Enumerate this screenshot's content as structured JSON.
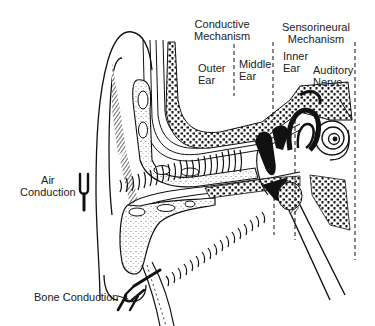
{
  "diagram": {
    "sections": {
      "conductive": {
        "line1": "Conductive",
        "line2": "Mechanism"
      },
      "sensorineural": {
        "line1": "Sensorineural",
        "line2": "Mechanism"
      }
    },
    "regions": {
      "outer_ear": {
        "line1": "Outer",
        "line2": "Ear"
      },
      "middle_ear": {
        "line1": "Middle",
        "line2": "Ear"
      },
      "inner_ear": {
        "line1": "Inner",
        "line2": "Ear"
      },
      "auditory_nerve": {
        "line1": "Auditory",
        "line2": "Nerve"
      }
    },
    "pathways": {
      "air": {
        "line1": "Air",
        "line2": "Conduction",
        "icon": "tuning-fork-icon"
      },
      "bone": {
        "label": "Bone Conduction",
        "icon": "tuning-fork-icon"
      }
    },
    "colors": {
      "ink": "#111111",
      "background": "#ffffff"
    }
  }
}
